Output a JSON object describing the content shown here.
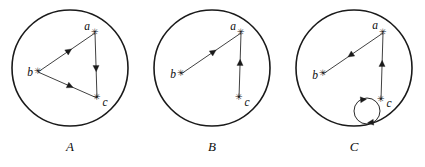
{
  "figure": {
    "title": "",
    "background_color": "#ffffff",
    "stroke_color": "#1a1a1a",
    "vertex_marker_glyph": "✳",
    "panel_count": 3
  },
  "panels": [
    {
      "id": "A",
      "label": "A",
      "label_x": 70,
      "label_y": 148,
      "boundary": {
        "cx": 70,
        "cy": 68,
        "r": 58
      },
      "vertices": [
        {
          "id": "a",
          "label": "a",
          "x": 95,
          "y": 33,
          "label_x": 87,
          "label_y": 27
        },
        {
          "id": "b",
          "label": "b",
          "x": 38,
          "y": 72,
          "label_x": 30,
          "label_y": 73
        },
        {
          "id": "c",
          "label": "c",
          "x": 97,
          "y": 98,
          "label_x": 105,
          "label_y": 103
        }
      ],
      "edges": [
        {
          "from": "b",
          "to": "a",
          "arrow_at": "midpoint",
          "direction": "b-to-a"
        },
        {
          "from": "a",
          "to": "c",
          "arrow_at": "midpoint",
          "direction": "a-to-c"
        },
        {
          "from": "b",
          "to": "c",
          "arrow_at": "midpoint",
          "direction": "b-to-c"
        }
      ],
      "self_loops": []
    },
    {
      "id": "B",
      "label": "B",
      "label_x": 212,
      "label_y": 148,
      "boundary": {
        "cx": 212,
        "cy": 68,
        "r": 58
      },
      "vertices": [
        {
          "id": "a",
          "label": "a",
          "x": 241,
          "y": 33,
          "label_x": 233,
          "label_y": 27
        },
        {
          "id": "b",
          "label": "b",
          "x": 181,
          "y": 74,
          "label_x": 173,
          "label_y": 75
        },
        {
          "id": "c",
          "label": "c",
          "x": 239,
          "y": 98,
          "label_x": 247,
          "label_y": 103
        }
      ],
      "edges": [
        {
          "from": "b",
          "to": "a",
          "arrow_at": "midpoint",
          "direction": "b-to-a"
        },
        {
          "from": "c",
          "to": "a",
          "arrow_at": "midpoint",
          "direction": "c-to-a"
        }
      ],
      "self_loops": []
    },
    {
      "id": "C",
      "label": "C",
      "label_x": 354,
      "label_y": 148,
      "boundary": {
        "cx": 354,
        "cy": 68,
        "r": 58
      },
      "vertices": [
        {
          "id": "a",
          "label": "a",
          "x": 383,
          "y": 33,
          "label_x": 375,
          "label_y": 26
        },
        {
          "id": "b",
          "label": "b",
          "x": 323,
          "y": 74,
          "label_x": 315,
          "label_y": 76
        },
        {
          "id": "c",
          "label": "c",
          "x": 381,
          "y": 100,
          "label_x": 389,
          "label_y": 104
        }
      ],
      "edges": [
        {
          "from": "a",
          "to": "b",
          "arrow_at": "midpoint",
          "direction": "a-to-b"
        },
        {
          "from": "c",
          "to": "a",
          "arrow_at": "midpoint",
          "direction": "c-to-a"
        }
      ],
      "self_loops": [
        {
          "at": "c",
          "cx": 367,
          "cy": 111,
          "r": 13,
          "arrow_count": 2
        }
      ]
    }
  ]
}
